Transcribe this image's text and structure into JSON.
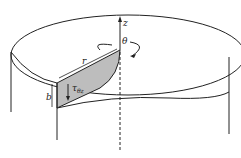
{
  "diagram": {
    "labels": {
      "z_axis": "z",
      "theta": "θ",
      "radius": "r",
      "thickness": "b",
      "shear_stress": "τ",
      "shear_sub": "θz"
    },
    "colors": {
      "stroke": "#222222",
      "shade": "#bdbdbd"
    }
  }
}
